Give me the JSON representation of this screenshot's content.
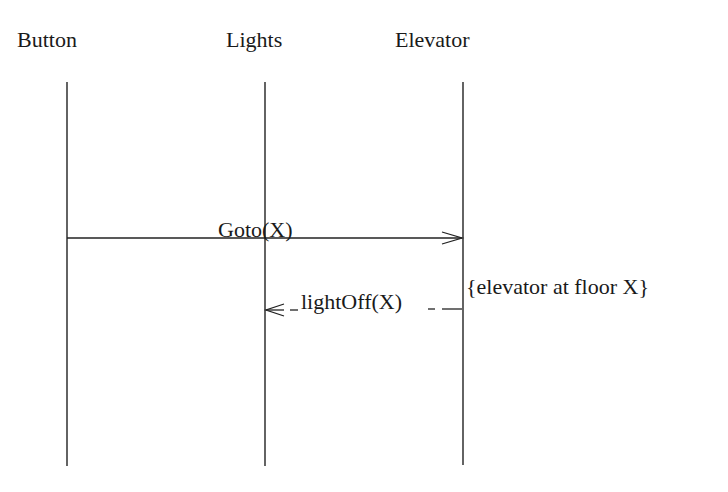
{
  "diagram": {
    "type": "sequence",
    "participants": [
      {
        "name": "Button",
        "x": 66
      },
      {
        "name": "Lights",
        "x": 264
      },
      {
        "name": "Elevator",
        "x": 462
      }
    ],
    "messages": [
      {
        "label": "Goto(X)",
        "from": "Button",
        "to": "Elevator",
        "style": "solid"
      },
      {
        "label": "lightOff(X)",
        "from": "Elevator",
        "to": "Lights",
        "style": "dashed"
      }
    ],
    "annotations": [
      {
        "text": "{elevator at floor X}",
        "attached_to": "Elevator"
      }
    ]
  }
}
